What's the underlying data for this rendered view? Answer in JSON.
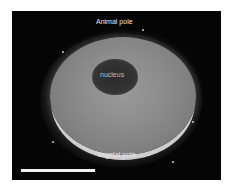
{
  "figure": {
    "type": "fluorescence micrograph",
    "labels": {
      "animal_pole": "Animal pole",
      "nucleus": "nucleus",
      "vegetal_pole": "Vegetal pole"
    },
    "scale_bar": {
      "visible": true,
      "color": "#f2f2f2"
    },
    "colors": {
      "background": "#050505",
      "cell": "#8c8c8c",
      "nucleus": "#333333",
      "label_text": "#e6e6e6"
    }
  }
}
